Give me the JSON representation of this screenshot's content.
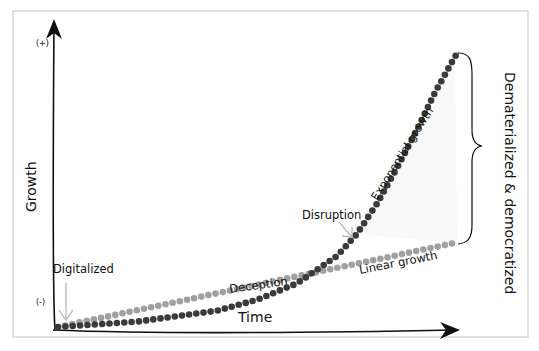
{
  "diagram": {
    "axes": {
      "y_label": "Growth",
      "x_label": "Time",
      "y_top_marker": "(+)",
      "y_bottom_marker": "(-)"
    },
    "annotations": {
      "digitalized": "Digitalized",
      "deception": "Deception",
      "disruption": "Disruption",
      "exponential_growth": "Exponential growth",
      "linear_growth": "Linear growth",
      "gap_label": "Dematerialized & democratized"
    },
    "colors": {
      "exponential_dots": "#3a3a3a",
      "linear_dots": "#a0a0a0",
      "arrow_hint": "#b5b5b5",
      "axis": "#111111",
      "frame": "#d0d0d0",
      "gap_fill": "#fafafa"
    }
  },
  "chart_data": {
    "type": "line",
    "title": "",
    "xlabel": "Time",
    "ylabel": "Growth",
    "series": [
      {
        "name": "Exponential growth",
        "style": "dotted-dark",
        "points": [
          [
            0,
            0
          ],
          [
            0.1,
            0.01
          ],
          [
            0.2,
            0.02
          ],
          [
            0.3,
            0.04
          ],
          [
            0.4,
            0.06
          ],
          [
            0.5,
            0.1
          ],
          [
            0.6,
            0.16
          ],
          [
            0.7,
            0.26
          ],
          [
            0.75,
            0.34
          ],
          [
            0.8,
            0.45
          ],
          [
            0.85,
            0.58
          ],
          [
            0.9,
            0.72
          ],
          [
            0.95,
            0.87
          ],
          [
            1.0,
            1.0
          ]
        ]
      },
      {
        "name": "Linear growth",
        "style": "dotted-light",
        "points": [
          [
            0,
            0
          ],
          [
            1.0,
            0.31
          ]
        ]
      }
    ],
    "phases": [
      "Digitalized",
      "Deception",
      "Disruption"
    ],
    "gap_annotation": "Dematerialized & democratized",
    "y_range_markers": [
      "(-)",
      "(+)"
    ],
    "grid": false,
    "legend": "inline labels"
  }
}
